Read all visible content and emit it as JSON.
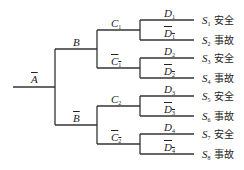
{
  "diagram": {
    "type": "event-tree",
    "root": {
      "label": "A",
      "negated": true
    },
    "level1": [
      {
        "label": "B",
        "negated": false
      },
      {
        "label": "B",
        "negated": true
      }
    ],
    "level2": [
      {
        "label": "C",
        "sub": "1",
        "negated": false
      },
      {
        "label": "C",
        "sub": "1",
        "negated": true
      },
      {
        "label": "C",
        "sub": "2",
        "negated": false
      },
      {
        "label": "C",
        "sub": "2",
        "negated": true
      }
    ],
    "level3": [
      {
        "label": "D",
        "sub": "1",
        "negated": false
      },
      {
        "label": "D",
        "sub": "1",
        "negated": true
      },
      {
        "label": "D",
        "sub": "2",
        "negated": false
      },
      {
        "label": "D",
        "sub": "2",
        "negated": true
      },
      {
        "label": "D",
        "sub": "3",
        "negated": false
      },
      {
        "label": "D",
        "sub": "3",
        "negated": true
      },
      {
        "label": "D",
        "sub": "4",
        "negated": false
      },
      {
        "label": "D",
        "sub": "4",
        "negated": true
      }
    ],
    "outcomes": [
      {
        "state": "S",
        "sub": "1",
        "result": "安全"
      },
      {
        "state": "S",
        "sub": "2",
        "result": "事故"
      },
      {
        "state": "S",
        "sub": "3",
        "result": "安全"
      },
      {
        "state": "S",
        "sub": "4",
        "result": "事故"
      },
      {
        "state": "S",
        "sub": "5",
        "result": "安全"
      },
      {
        "state": "S",
        "sub": "6",
        "result": "事故"
      },
      {
        "state": "S",
        "sub": "7",
        "result": "安全"
      },
      {
        "state": "S",
        "sub": "8",
        "result": "事故"
      }
    ],
    "line_color": "#333333"
  }
}
